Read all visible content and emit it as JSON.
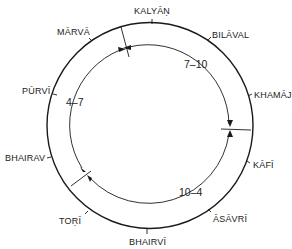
{
  "diagram": {
    "type": "circular-time-cycle",
    "center": [
      150,
      125.5
    ],
    "outer_radius": 103,
    "inner_radius": 81,
    "stroke_color": "#1a1a1a",
    "thats": [
      {
        "name": "KALYĀṆ",
        "x": 154,
        "y": 14
      },
      {
        "name": "BILĀVAL",
        "x": 212,
        "y": 35
      },
      {
        "name": "KHAMĀJ",
        "x": 254,
        "y": 95
      },
      {
        "name": "KĀFĪ",
        "x": 252,
        "y": 168
      },
      {
        "name": "ĀSĀVRĪ",
        "x": 213,
        "y": 221
      },
      {
        "name": "BHAIRVĪ",
        "x": 147,
        "y": 245
      },
      {
        "name": "TOṚĪ",
        "x": 59,
        "y": 224
      },
      {
        "name": "BHAIRAV",
        "x": 5,
        "y": 161
      },
      {
        "name": "PŪRVĪ",
        "x": 22,
        "y": 89
      },
      {
        "name": "MĀRVĀ",
        "x": 57,
        "y": 33
      }
    ],
    "time_periods": [
      {
        "label": "7–10",
        "x": 186,
        "y": 66
      },
      {
        "label": "10–4",
        "x": 180,
        "y": 195
      },
      {
        "label": "4–7",
        "x": 67,
        "y": 104
      }
    ]
  }
}
